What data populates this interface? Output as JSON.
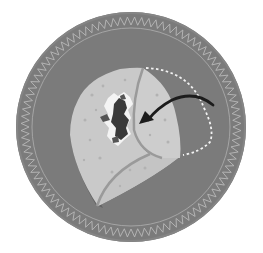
{
  "illustration": {
    "title": "Folding a tortilla",
    "subject": "tortilla-fold-instruction",
    "colors": {
      "background": "#ffffff",
      "plate": "#7b7b7b",
      "plate_border": "#8a8a8a",
      "zigzag": "#b9b9b9",
      "inner_ring": "#a9a9a9",
      "tortilla": "#c9c9c9",
      "tortilla_spots": "#b0b0b0",
      "tortilla_shadow": "#646464",
      "tortilla_edge": "#9a9a9a",
      "filling_dark": "#3a3a3a",
      "filling_mid": "#555555",
      "filling_light": "#f4f4f4",
      "arrow": "#1c1c1c",
      "dashed_outline": "#f2f2f2"
    },
    "icons": [
      "plate-icon",
      "tortilla-icon",
      "filling-icon",
      "fold-arrow-icon",
      "dashed-fold-outline"
    ]
  }
}
